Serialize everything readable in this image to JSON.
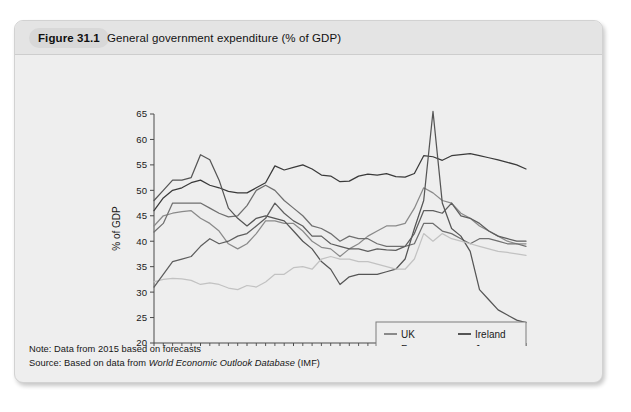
{
  "figure": {
    "tag": "Figure 31.1",
    "title": "General government expenditure (% of GDP)"
  },
  "notes": {
    "note_prefix": "Note: Data from 2015 based on forecasts",
    "source_prefix": "Source: Based on data from ",
    "source_italic": "World Economic Outlook Database",
    "source_suffix": " (IMF)"
  },
  "chart_data": {
    "type": "line",
    "title": "General government expenditure (% of GDP)",
    "xlabel": "",
    "ylabel": "% of GDP",
    "xlim": [
      1980,
      2020
    ],
    "ylim": [
      20,
      65
    ],
    "ytick_step": 5,
    "yticks": [
      20,
      25,
      30,
      35,
      40,
      45,
      50,
      55,
      60,
      65
    ],
    "xticks": [
      1980,
      1985,
      1990,
      1995,
      2000,
      2005,
      2010,
      2015,
      2020
    ],
    "xminor_step": 1,
    "grid": false,
    "legend_position": "lower-right-inside",
    "x": [
      1980,
      1981,
      1982,
      1983,
      1984,
      1985,
      1986,
      1987,
      1988,
      1989,
      1990,
      1991,
      1992,
      1993,
      1994,
      1995,
      1996,
      1997,
      1998,
      1999,
      2000,
      2001,
      2002,
      2003,
      2004,
      2005,
      2006,
      2007,
      2008,
      2009,
      2010,
      2011,
      2012,
      2013,
      2014,
      2015,
      2016,
      2017,
      2018,
      2019,
      2020
    ],
    "series": [
      {
        "name": "UK",
        "color": "#8a8a8a",
        "values": [
          43.0,
          45.0,
          45.5,
          45.8,
          46.0,
          44.5,
          43.5,
          42.0,
          39.5,
          38.5,
          39.5,
          41.5,
          44.0,
          44.0,
          43.5,
          43.5,
          42.0,
          40.0,
          38.8,
          38.5,
          37.0,
          38.5,
          39.5,
          41.0,
          42.0,
          43.0,
          43.0,
          43.5,
          46.5,
          50.5,
          49.5,
          48.0,
          47.5,
          45.5,
          44.5,
          43.0,
          42.0,
          41.0,
          40.0,
          39.5,
          39.5
        ]
      },
      {
        "name": "France",
        "color": "#3a3a3a",
        "values": [
          46.0,
          48.5,
          50.0,
          50.5,
          51.5,
          52.0,
          51.0,
          50.5,
          49.8,
          49.5,
          49.5,
          50.5,
          51.5,
          54.8,
          54.0,
          54.5,
          55.0,
          54.2,
          53.0,
          52.8,
          51.7,
          51.8,
          52.8,
          53.2,
          53.0,
          53.3,
          52.7,
          52.6,
          53.3,
          56.8,
          56.6,
          55.9,
          56.8,
          57.0,
          57.2,
          56.8,
          56.4,
          56.0,
          55.5,
          55.0,
          54.2
        ]
      },
      {
        "name": "Canada",
        "color": "#6f6f6f",
        "values": [
          41.8,
          43.5,
          47.5,
          47.5,
          47.5,
          47.5,
          46.5,
          45.5,
          44.8,
          45.0,
          47.0,
          50.0,
          51.0,
          50.0,
          48.0,
          46.5,
          45.0,
          43.0,
          42.5,
          41.5,
          40.0,
          41.0,
          40.5,
          40.5,
          39.5,
          39.0,
          39.0,
          39.0,
          39.5,
          43.5,
          43.5,
          42.0,
          41.5,
          40.5,
          39.5,
          40.5,
          40.5,
          40.0,
          39.5,
          39.5,
          39.0
        ]
      },
      {
        "name": "Ireland",
        "color": "#555555",
        "values": [
          48.0,
          50.0,
          52.0,
          52.0,
          52.5,
          57.0,
          56.0,
          52.0,
          46.5,
          44.5,
          43.0,
          44.5,
          45.0,
          44.5,
          44.0,
          42.0,
          40.0,
          38.5,
          36.0,
          34.5,
          31.5,
          33.0,
          33.5,
          33.5,
          33.5,
          34.0,
          34.5,
          36.5,
          42.5,
          48.0,
          65.5,
          47.5,
          42.5,
          41.0,
          38.0,
          30.5,
          28.5,
          26.5,
          25.5,
          24.5,
          24.0
        ]
      },
      {
        "name": "Japan",
        "color": "#c2c2c2",
        "values": [
          32.0,
          32.5,
          32.7,
          32.6,
          32.3,
          31.5,
          31.8,
          31.5,
          30.8,
          30.5,
          31.3,
          31.0,
          32.0,
          33.5,
          33.5,
          34.8,
          35.0,
          34.5,
          36.5,
          37.0,
          36.5,
          36.5,
          36.0,
          36.0,
          35.5,
          35.0,
          34.5,
          34.5,
          36.5,
          41.5,
          40.0,
          41.5,
          40.5,
          40.0,
          39.5,
          39.0,
          38.5,
          38.0,
          37.8,
          37.5,
          37.2
        ]
      },
      {
        "name": "Spain",
        "color": "#5e5e5e",
        "values": [
          31.0,
          33.5,
          36.0,
          36.5,
          37.0,
          39.0,
          40.5,
          39.5,
          40.0,
          41.0,
          41.5,
          43.0,
          44.5,
          47.5,
          45.5,
          44.0,
          43.0,
          41.0,
          41.0,
          39.5,
          39.0,
          38.5,
          38.5,
          38.0,
          38.5,
          38.3,
          38.2,
          39.0,
          41.5,
          46.0,
          46.0,
          45.5,
          47.5,
          45.0,
          44.5,
          43.5,
          42.0,
          41.0,
          40.5,
          40.0,
          40.0
        ]
      }
    ],
    "legend": [
      {
        "name": "UK",
        "color": "#8a8a8a"
      },
      {
        "name": "Ireland",
        "color": "#555555"
      },
      {
        "name": "France",
        "color": "#3a3a3a"
      },
      {
        "name": "Japan",
        "color": "#c2c2c2"
      },
      {
        "name": "Canada",
        "color": "#6f6f6f"
      },
      {
        "name": "Spain",
        "color": "#5e5e5e"
      }
    ]
  }
}
